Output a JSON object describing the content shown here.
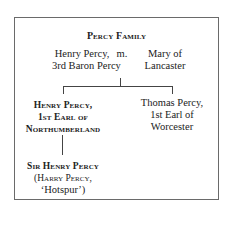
{
  "title": "Percy Family",
  "parents": {
    "father": [
      "Henry Percy,",
      "3rd Baron Percy"
    ],
    "marriage_label": "m.",
    "mother": [
      "Mary of",
      "Lancaster"
    ]
  },
  "children": [
    {
      "lines": [
        "Henry Percy,",
        "1st Earl of",
        "Northumberland"
      ],
      "emphasis": "bold-small-caps"
    },
    {
      "lines": [
        "Thomas Percy,",
        "1st Earl of",
        "Worcester"
      ],
      "emphasis": "normal"
    }
  ],
  "grandchild": {
    "lines": [
      "Sir Henry Percy",
      "(Harry Percy,",
      "‘Hotspur’)"
    ]
  }
}
